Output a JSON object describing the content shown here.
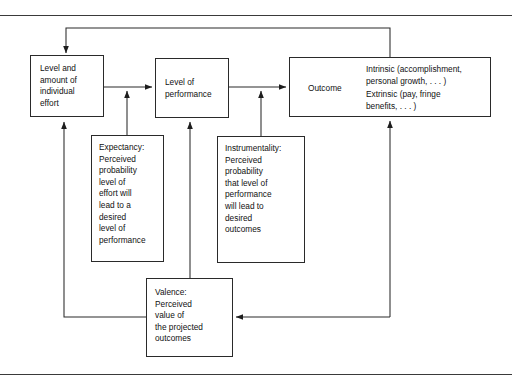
{
  "diagram": {
    "type": "flow-diagram",
    "nodes": {
      "effort": {
        "label": "Level and\namount of\nindividual\neffort"
      },
      "performance": {
        "label": "Level of\nperformance"
      },
      "outcome": {
        "label": "Outcome",
        "intrinsic": "Intrinsic (accomplishment,\npersonal growth, . . . )",
        "extrinsic": "Extrinsic (pay, fringe\nbenefits, . . . )"
      },
      "expectancy": {
        "label": "Expectancy:\nPerceived\nprobability\nlevel of\neffort will\nlead to a\ndesired\nlevel of\nperformance"
      },
      "instrumentality": {
        "label": "Instrumentality:\nPerceived\nprobability\nthat level of\nperformance\nwill lead to\ndesired\noutcomes"
      },
      "valence": {
        "label": "Valence:\nPerceived\nvalue of\nthe projected\noutcomes"
      }
    },
    "edges": [
      {
        "from": "effort",
        "to": "performance",
        "style": "arrow-right"
      },
      {
        "from": "performance",
        "to": "outcome",
        "style": "arrow-right"
      },
      {
        "from": "outcome",
        "to": "intrinsic",
        "style": "arrow-up-right"
      },
      {
        "from": "outcome",
        "to": "extrinsic",
        "style": "arrow-down-right"
      },
      {
        "from": "expectancy",
        "to": "effort-performance-link",
        "style": "arrow-up"
      },
      {
        "from": "instrumentality",
        "to": "performance-outcome-link",
        "style": "arrow-up"
      },
      {
        "from": "valence",
        "to": "performance",
        "style": "arrow-up"
      },
      {
        "from": "outcome",
        "to": "effort",
        "style": "feedback-top-arrow-down"
      },
      {
        "from": "valence",
        "to": "effort",
        "style": "feedback-left-arrow-up"
      },
      {
        "from": "outcome",
        "to": "valence",
        "style": "feedback-right-arrow-left"
      }
    ],
    "colors": {
      "stroke": "#2a2a2a",
      "rule": "#3a3a3a",
      "background": "#ffffff",
      "text": "#111111"
    }
  }
}
